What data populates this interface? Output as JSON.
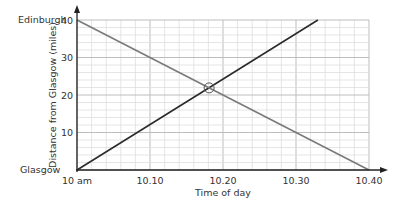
{
  "chart_data": {
    "type": "line",
    "title": "",
    "xlabel": "Time of day",
    "ylabel": "Distance from Glasgow (miles)",
    "x_ticks": [
      {
        "value": 0,
        "label": "10 am"
      },
      {
        "value": 10,
        "label": "10.10"
      },
      {
        "value": 20,
        "label": "10.20"
      },
      {
        "value": 30,
        "label": "10.30"
      },
      {
        "value": 40,
        "label": "10.40"
      }
    ],
    "y_ticks": [
      {
        "value": 10,
        "label": "10"
      },
      {
        "value": 20,
        "label": "20"
      },
      {
        "value": 30,
        "label": "30"
      },
      {
        "value": 40,
        "label": "40"
      }
    ],
    "y_place_labels": {
      "top": "Edinburgh",
      "bottom": "Glasgow"
    },
    "xlim": [
      0,
      40
    ],
    "ylim": [
      0,
      40
    ],
    "grid": {
      "major_step": 10,
      "minor_step": 2
    },
    "series": [
      {
        "name": "Glasgow to Edinburgh",
        "color": "#2b2b2b",
        "points": [
          [
            0,
            0
          ],
          [
            33,
            40
          ]
        ]
      },
      {
        "name": "Edinburgh to Glasgow",
        "color": "#7a7a7a",
        "points": [
          [
            0,
            40
          ],
          [
            40,
            0
          ]
        ]
      }
    ],
    "annotations": [
      {
        "type": "circle",
        "x": 18.1,
        "y": 21.9,
        "note": "meeting point"
      }
    ]
  }
}
